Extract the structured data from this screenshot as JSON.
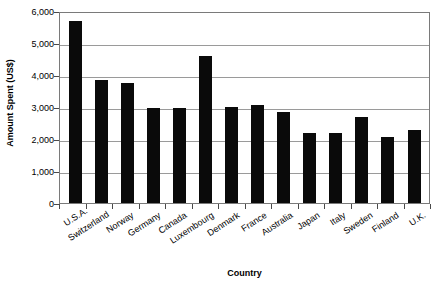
{
  "chart_data": {
    "type": "bar",
    "title": "",
    "xlabel": "Country",
    "ylabel": "Amount Spent (US$)",
    "categories": [
      "U.S.A.",
      "Switzerland",
      "Norway",
      "Germany",
      "Canada",
      "Luxembourg",
      "Denmark",
      "France",
      "Australia",
      "Japan",
      "Italy",
      "Sweden",
      "Finland",
      "U.K."
    ],
    "values": [
      5700,
      3850,
      3750,
      2980,
      2970,
      4600,
      3000,
      3050,
      2850,
      2200,
      2200,
      2680,
      2050,
      2280
    ],
    "series": [
      {
        "name": "Amount Spent (US$)",
        "values": [
          5700,
          3850,
          3750,
          2980,
          2970,
          4600,
          3000,
          3050,
          2850,
          2200,
          2200,
          2680,
          2050,
          2280
        ]
      }
    ],
    "ylim": [
      0,
      6000
    ],
    "ytick_values": [
      0,
      1000,
      2000,
      3000,
      4000,
      5000,
      6000
    ],
    "ytick_labels": [
      "0",
      "1,000",
      "2,000",
      "3,000",
      "4,000",
      "5,000",
      "6,000"
    ],
    "grid": true,
    "grid_axis": "y",
    "legend": false,
    "legend_position": "none",
    "bar_color": "#0a0a0a",
    "gridline_color": "#9a9a9a",
    "axis_color": "#7a7a7a",
    "background_color": "#ffffff",
    "xtick_label_rotation": -33
  }
}
